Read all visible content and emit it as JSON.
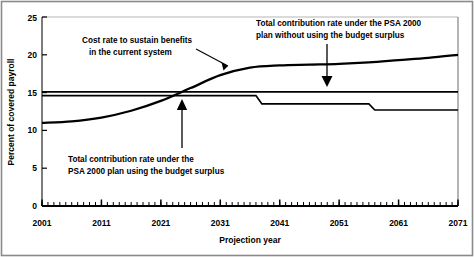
{
  "chart_data": {
    "type": "line",
    "title": "",
    "xlabel": "Projection year",
    "ylabel": "Percent of covered payroll",
    "xlim": [
      2001,
      2071
    ],
    "ylim": [
      0,
      25
    ],
    "grid": false,
    "legend_position": "none",
    "xticks": [
      "2001",
      "2011",
      "2021",
      "2031",
      "2041",
      "2051",
      "2061",
      "2071"
    ],
    "xtick_values": [
      2001,
      2011,
      2021,
      2031,
      2041,
      2051,
      2061,
      2071
    ],
    "minor_tick_interval": 1,
    "yticks": [
      "0",
      "5",
      "10",
      "15",
      "20",
      "25"
    ],
    "ytick_values": [
      0,
      5,
      10,
      15,
      20,
      25
    ],
    "series": [
      {
        "name": "Cost rate to sustain benefits in the current system",
        "x": [
          2001,
          2006,
          2011,
          2016,
          2021,
          2026,
          2031,
          2036,
          2041,
          2046,
          2051,
          2056,
          2061,
          2066,
          2071
        ],
        "values": [
          11.0,
          11.2,
          11.7,
          12.6,
          13.9,
          15.6,
          17.3,
          18.3,
          18.6,
          18.7,
          18.8,
          19.0,
          19.3,
          19.6,
          20.0
        ]
      },
      {
        "name": "Total contribution rate under the PSA 2000 plan without using the budget surplus",
        "x": [
          2001,
          2071
        ],
        "values": [
          15.1,
          15.1
        ]
      },
      {
        "name": "Total contribution rate under the PSA 2000 plan using the budget surplus",
        "x": [
          2001,
          2037,
          2038,
          2056,
          2057,
          2071
        ],
        "values": [
          14.6,
          14.6,
          13.5,
          13.5,
          12.7,
          12.7
        ]
      }
    ],
    "annotations": [
      {
        "id": "cost-rate-annotation",
        "line1": "Cost rate to sustain benefits",
        "line2": "in the current system",
        "arrow": "diagonal-down-right"
      },
      {
        "id": "no-surplus-annotation",
        "line1": "Total contribution rate under the PSA 2000",
        "line2": "plan without using the budget surplus",
        "arrow": "down"
      },
      {
        "id": "surplus-annotation",
        "line1": "Total contribution rate under the",
        "line2": "PSA 2000 plan using the budget surplus",
        "arrow": "up"
      }
    ],
    "colors": {
      "line": "#000000",
      "axis": "#000000",
      "background": "#ffffff",
      "border": "#7a7a7a"
    }
  }
}
